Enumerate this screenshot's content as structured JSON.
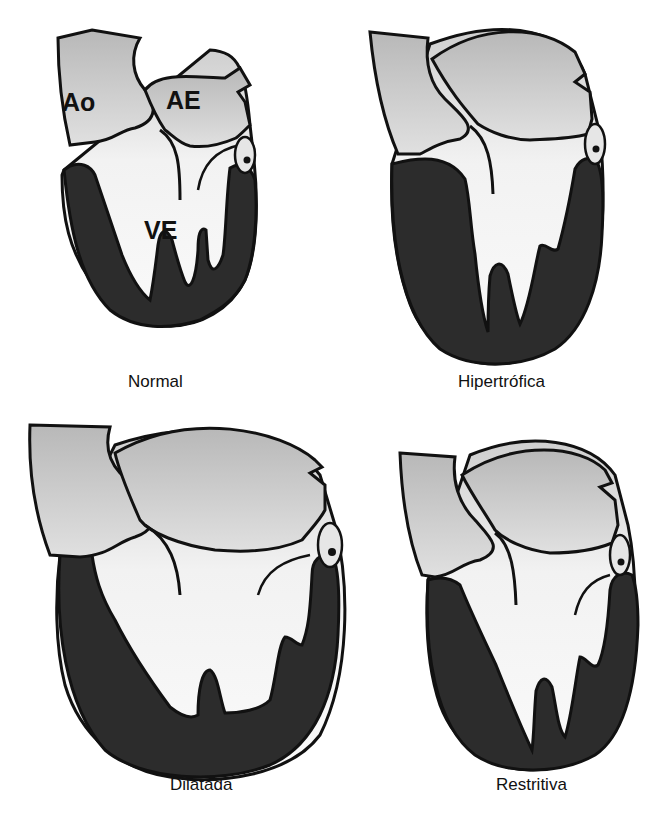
{
  "figure": {
    "colors": {
      "background": "#ffffff",
      "myocardium": "#2c2c2c",
      "aorta_atrium": "#bdbdbd",
      "cavity": "#f4f4f4",
      "outline": "#111111",
      "valve": "#e6e6e6"
    },
    "panels": [
      {
        "id": "normal",
        "label": "Normal",
        "chamber_labels": {
          "aorta": "Ao",
          "left_atrium": "AE",
          "left_ventricle": "VE"
        }
      },
      {
        "id": "hypertrophic",
        "label": "Hipertrófica"
      },
      {
        "id": "dilated",
        "label": "Dilatada"
      },
      {
        "id": "restrictive",
        "label": "Restritiva"
      }
    ],
    "caption_truncated": {
      "text": "",
      "note": "Bottom line is cut off at the image edge; only tops of glyphs are visible and the text cannot be read reliably."
    }
  }
}
